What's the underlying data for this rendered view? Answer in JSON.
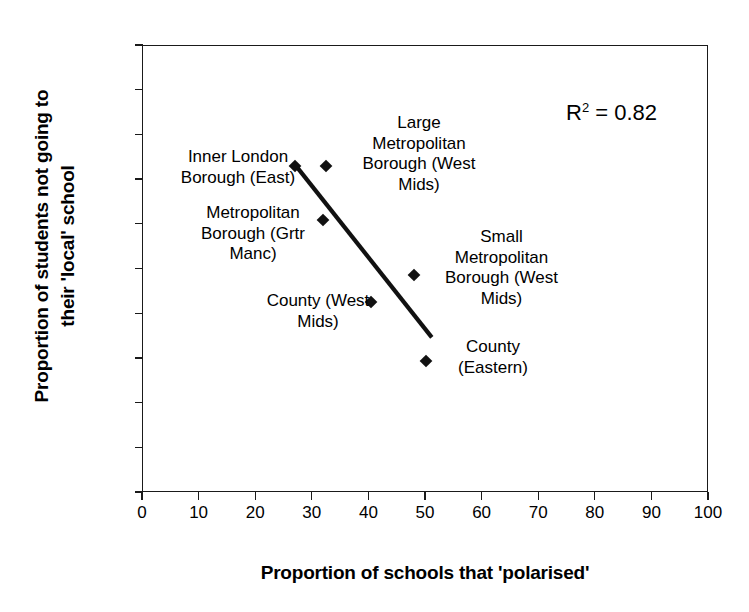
{
  "chart_data": {
    "type": "scatter",
    "title": "",
    "xlabel": "Proportion of schools that 'polarised'",
    "ylabel_line1": "Proportion of students not going to",
    "ylabel_line2": "their 'local' school",
    "xlim": [
      0,
      100
    ],
    "ylim": [
      0,
      100
    ],
    "xticks": [
      0,
      10,
      20,
      30,
      40,
      50,
      60,
      70,
      80,
      90,
      100
    ],
    "yticks": [
      0,
      10,
      20,
      30,
      40,
      50,
      60,
      70,
      80,
      90,
      100
    ],
    "grid": false,
    "legend": "none",
    "marker_style": "filled-diamond",
    "marker_color": "#111111",
    "points": [
      {
        "label": "Inner London Borough (East)",
        "x": 27.0,
        "y": 73.0
      },
      {
        "label": "Large Metropolitan Borough (West Mids)",
        "x": 32.5,
        "y": 73.0
      },
      {
        "label": "Metropolitan Borough (Grtr Manc)",
        "x": 32.0,
        "y": 60.8
      },
      {
        "label": "Small Metropolitan Borough (West Mids)",
        "x": 48.0,
        "y": 48.6
      },
      {
        "label": "County (West Mids)",
        "x": 40.5,
        "y": 42.5
      },
      {
        "label": "County (Eastern)",
        "x": 50.2,
        "y": 29.4
      }
    ],
    "trendline": {
      "type": "linear",
      "x_start": 27.0,
      "y_start": 73.3,
      "x_end": 51.2,
      "y_end": 34.6,
      "color": "#111111"
    },
    "annotations": [
      {
        "name": "r-squared",
        "text_prefix": "R",
        "text_sup": "2",
        "text_suffix": " = 0.82",
        "value": 0.82
      }
    ],
    "point_labels": [
      {
        "name": "inner-london-borough-east",
        "text": "Inner London\nBorough (East)",
        "left": 163,
        "top": 147,
        "width": 150
      },
      {
        "name": "large-metropolitan-borough-west-mids",
        "text": "Large\nMetropolitan\nBorough (West\nMids)",
        "left": 343,
        "top": 113,
        "width": 152
      },
      {
        "name": "metropolitan-borough-grtr-manc",
        "text": "Metropolitan\nBorough (Grtr\nManc)",
        "left": 182,
        "top": 203,
        "width": 142
      },
      {
        "name": "small-metropolitan-borough-west-mids",
        "text": "Small\nMetropolitan\nBorough (West\nMids)",
        "left": 424,
        "top": 227,
        "width": 155
      },
      {
        "name": "county-west-mids",
        "text": "County (West\nMids)",
        "left": 238,
        "top": 291,
        "width": 160
      },
      {
        "name": "county-eastern",
        "text": "County\n(Eastern)",
        "left": 434,
        "top": 337,
        "width": 118
      }
    ]
  }
}
